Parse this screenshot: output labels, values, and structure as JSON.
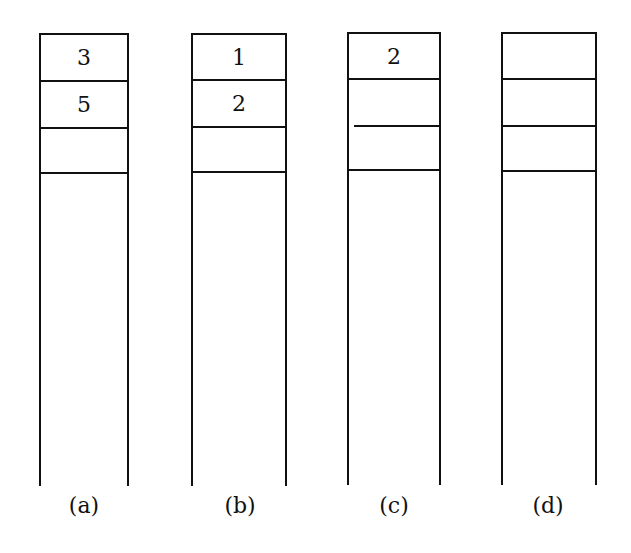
{
  "figure": {
    "stacks": [
      {
        "label": "(a)",
        "cells": [
          "3",
          "5",
          ""
        ]
      },
      {
        "label": "(b)",
        "cells": [
          "1",
          "2",
          ""
        ]
      },
      {
        "label": "(c)",
        "cells": [
          "2",
          "",
          ""
        ]
      },
      {
        "label": "(d)",
        "cells": [
          "",
          "",
          ""
        ]
      }
    ]
  }
}
